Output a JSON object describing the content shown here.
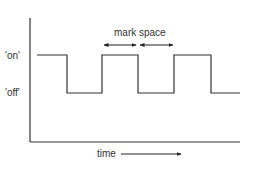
{
  "diagram": {
    "title": "",
    "labels": {
      "on": "'on'",
      "off": "'off'",
      "mark_space": "mark space",
      "time": "time"
    },
    "colors": {
      "line": "#333333",
      "background": "#ffffff"
    },
    "axes": {
      "y_axis": {
        "x": 30,
        "y_top": 18,
        "y_bottom": 142
      },
      "x_axis": {
        "y": 142,
        "x_left": 30,
        "x_right": 240
      }
    },
    "waveform": {
      "type": "square-wave",
      "on_level_y": 55,
      "off_level_y": 93,
      "points": [
        [
          37,
          55
        ],
        [
          67,
          55
        ],
        [
          67,
          93
        ],
        [
          102,
          93
        ],
        [
          102,
          55
        ],
        [
          138,
          55
        ],
        [
          138,
          93
        ],
        [
          174,
          93
        ],
        [
          174,
          55
        ],
        [
          211,
          55
        ],
        [
          211,
          93
        ],
        [
          240,
          93
        ]
      ]
    },
    "annotations": [
      {
        "label": "mark",
        "arrow_from_x": 103,
        "arrow_to_x": 137,
        "y": 45,
        "double_headed": true
      },
      {
        "label": "space",
        "arrow_from_x": 139,
        "arrow_to_x": 174,
        "y": 45,
        "double_headed": true
      },
      {
        "label": "time",
        "arrow_from_x": 121,
        "arrow_to_x": 182,
        "y": 154,
        "double_headed": false
      }
    ]
  }
}
